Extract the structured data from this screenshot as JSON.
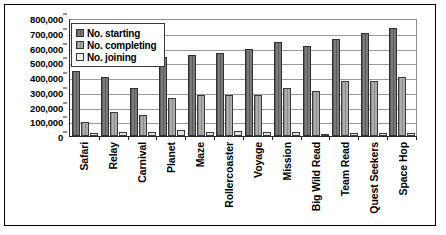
{
  "chart_data": {
    "type": "bar",
    "title": "",
    "xlabel": "",
    "ylabel": "",
    "ylim": [
      0,
      800000
    ],
    "ytick_step": 100000,
    "grid": true,
    "legend_position": "top-left",
    "ytick_labels": [
      "800,000",
      "700,000",
      "600,000",
      "500,000",
      "400,000",
      "300,000",
      "200,000",
      "100,000",
      "0"
    ],
    "categories": [
      "Safari",
      "Relay",
      "Carnival",
      "Planet",
      "Maze",
      "Rollercoaster",
      "Voyage",
      "Mission",
      "Big Wild Read",
      "Team Read",
      "Quest Seekers",
      "Space Hop"
    ],
    "series": [
      {
        "name": "No. starting",
        "color": "#6e6e6e",
        "values": [
          440000,
          400000,
          325000,
          535000,
          550000,
          565000,
          590000,
          640000,
          610000,
          660000,
          700000,
          730000
        ]
      },
      {
        "name": "No. completing",
        "color": "#9d9d9d",
        "values": [
          95000,
          160000,
          145000,
          255000,
          280000,
          275000,
          280000,
          325000,
          305000,
          375000,
          375000,
          400000
        ]
      },
      {
        "name": "No. joining",
        "color": "#e2e2e2",
        "values": [
          18000,
          30000,
          26000,
          38000,
          24000,
          34000,
          30000,
          26000,
          14000,
          22000,
          20000,
          18000
        ]
      }
    ]
  }
}
